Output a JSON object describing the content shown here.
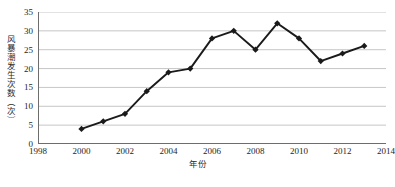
{
  "chart_data": {
    "type": "line",
    "title": "",
    "subtitle": "",
    "xlabel": "年份",
    "ylabel": "风暴潮发生次数（次）",
    "x": [
      2000,
      2001,
      2002,
      2003,
      2004,
      2005,
      2006,
      2007,
      2008,
      2009,
      2010,
      2011,
      2012,
      2013
    ],
    "values": [
      4,
      6,
      8,
      14,
      19,
      20,
      28,
      30,
      25,
      32,
      28,
      22,
      24,
      26
    ],
    "series": [
      {
        "name": "风暴潮发生次数",
        "values": [
          4,
          6,
          8,
          14,
          19,
          20,
          28,
          30,
          25,
          32,
          28,
          22,
          24,
          26
        ]
      }
    ],
    "xlim": [
      1998,
      2014
    ],
    "ylim": [
      0,
      35
    ],
    "x_ticks": [
      1998,
      2000,
      2002,
      2004,
      2006,
      2008,
      2010,
      2012,
      2014
    ],
    "x_tick_labels": [
      "1998",
      "2000",
      "2002",
      "2004",
      "2006",
      "2008",
      "2010",
      "2012",
      "2014"
    ],
    "y_ticks": [
      0,
      5,
      10,
      15,
      20,
      25,
      30,
      35
    ],
    "y_tick_labels": [
      "0",
      "5",
      "10",
      "15",
      "20",
      "25",
      "30",
      "35"
    ],
    "grid": "horizontal",
    "legend": "none",
    "marker": "diamond",
    "line_color": "#1a1a1a",
    "marker_color": "#1a1a1a",
    "grid_color": "#b8b8b8",
    "axis_color": "#6d6d6d",
    "background": "#ffffff",
    "annotations": []
  }
}
